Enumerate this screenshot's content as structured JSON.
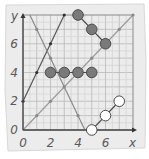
{
  "chart_data": {
    "type": "line",
    "title": "",
    "xlabel": "x",
    "ylabel": "y",
    "xlim": [
      0,
      8
    ],
    "ylim": [
      0,
      8
    ],
    "grid": true,
    "x_ticks": [
      {
        "value": 0,
        "label": "0"
      },
      {
        "value": 2,
        "label": "2"
      },
      {
        "value": 4,
        "label": "4"
      },
      {
        "value": 6,
        "label": "6"
      }
    ],
    "y_ticks": [
      {
        "value": 0,
        "label": "0"
      },
      {
        "value": 2,
        "label": "2"
      },
      {
        "value": 4,
        "label": "4"
      },
      {
        "value": 6,
        "label": "6"
      }
    ],
    "lines": [
      {
        "name": "line-y-equals-x",
        "color": "#9a9a9a",
        "width": 1.2,
        "from": [
          0,
          0
        ],
        "to": [
          8,
          8
        ],
        "dots": [
          [
            1,
            1
          ],
          [
            2,
            2
          ],
          [
            3,
            3
          ],
          [
            5,
            5
          ],
          [
            7,
            7
          ],
          [
            8,
            8
          ]
        ],
        "dot_color": "#8a8a8a",
        "dot_r": 1.6
      },
      {
        "name": "line-y-equals-2x-plus-2",
        "color": "#555555",
        "width": 1.2,
        "from": [
          0,
          2
        ],
        "to": [
          3,
          8
        ],
        "dots": [
          [
            0,
            2
          ],
          [
            1,
            4
          ],
          [
            2,
            6
          ],
          [
            3,
            8
          ]
        ],
        "dot_color": "#333333",
        "dot_r": 1.6
      },
      {
        "name": "line-y-equals-9-minus-2x",
        "color": "#8a8a8a",
        "width": 1.2,
        "from": [
          0.5,
          8
        ],
        "to": [
          4.5,
          0
        ],
        "dots": [
          [
            1,
            7
          ],
          [
            2,
            5
          ],
          [
            4,
            1
          ]
        ],
        "dot_color": "#8a8a8a",
        "dot_r": 1.6
      }
    ],
    "series": [
      {
        "name": "gray-diagonal-points",
        "style": "filled",
        "fill": "#7a7a7a",
        "stroke": "#4a4a4a",
        "connected": true,
        "points": [
          [
            4,
            8
          ],
          [
            5,
            7
          ],
          [
            6,
            6
          ]
        ]
      },
      {
        "name": "gray-horizontal-points",
        "style": "filled",
        "fill": "#7a7a7a",
        "stroke": "#4a4a4a",
        "connected": true,
        "points": [
          [
            2,
            4
          ],
          [
            3,
            4
          ],
          [
            4,
            4
          ],
          [
            5,
            4
          ]
        ]
      },
      {
        "name": "white-points",
        "style": "open",
        "fill": "#ffffff",
        "stroke": "#4a4a4a",
        "connected": true,
        "points": [
          [
            5,
            0
          ],
          [
            6,
            1
          ],
          [
            7,
            2
          ]
        ]
      }
    ]
  },
  "colors": {
    "panel": "#ececec",
    "panel_border": "#d8d8d8",
    "grid_major": "#b9b9b9",
    "grid_minor": "#d6d6d6",
    "axis": "#4a4a4a"
  }
}
